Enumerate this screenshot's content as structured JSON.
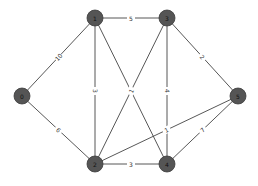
{
  "graph": {
    "nodes": [
      {
        "id": "0",
        "label": "0",
        "x": 22,
        "y": 96
      },
      {
        "id": "1",
        "label": "1",
        "x": 95,
        "y": 18
      },
      {
        "id": "2",
        "label": "2",
        "x": 95,
        "y": 164
      },
      {
        "id": "3",
        "label": "3",
        "x": 167,
        "y": 18
      },
      {
        "id": "4",
        "label": "4",
        "x": 167,
        "y": 164
      },
      {
        "id": "5",
        "label": "5",
        "x": 238,
        "y": 96
      }
    ],
    "edges": [
      {
        "from": "0",
        "to": "1",
        "weight": "10"
      },
      {
        "from": "0",
        "to": "2",
        "weight": "6"
      },
      {
        "from": "1",
        "to": "3",
        "weight": "5"
      },
      {
        "from": "1",
        "to": "2",
        "weight": "3"
      },
      {
        "from": "1",
        "to": "4",
        "weight": "7"
      },
      {
        "from": "3",
        "to": "2",
        "weight": "1"
      },
      {
        "from": "3",
        "to": "4",
        "weight": "4"
      },
      {
        "from": "3",
        "to": "5",
        "weight": "2"
      },
      {
        "from": "5",
        "to": "2",
        "weight": "1"
      },
      {
        "from": "5",
        "to": "4",
        "weight": "7"
      },
      {
        "from": "2",
        "to": "4",
        "weight": "3"
      }
    ]
  }
}
